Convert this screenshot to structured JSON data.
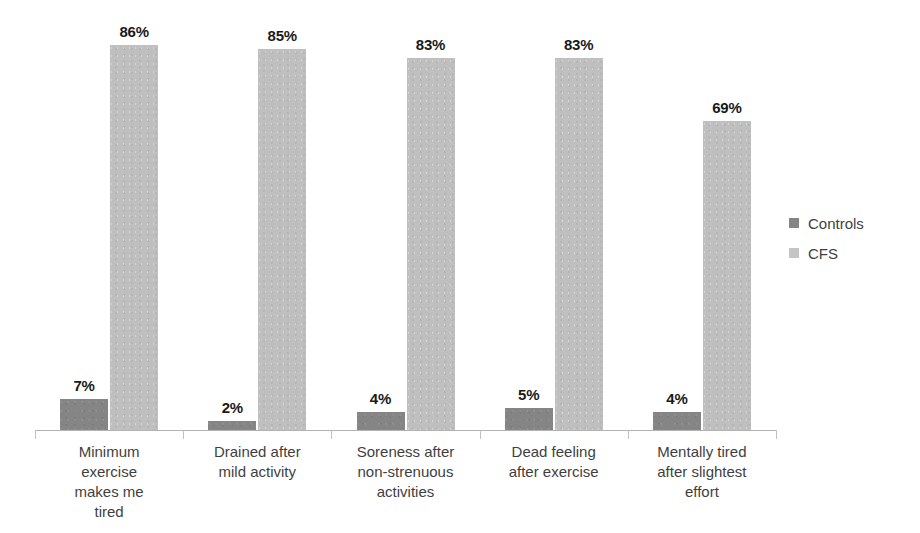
{
  "chart_data": {
    "type": "bar",
    "title": "",
    "subtitle": "",
    "xlabel": "",
    "ylabel": "",
    "ylim": [
      0,
      95
    ],
    "grid": false,
    "legend_position": "right",
    "value_suffix": "%",
    "categories": [
      "Minimum exercise makes me tired",
      "Drained after mild activity",
      "Soreness after non-strenuous activities",
      "Dead feeling after exercise",
      "Mentally tired after slightest effort"
    ],
    "category_lines": [
      [
        "Minimum",
        "exercise",
        "makes me",
        "tired"
      ],
      [
        "Drained after",
        "mild activity"
      ],
      [
        "Soreness after",
        "non-strenuous",
        "activities"
      ],
      [
        "Dead feeling",
        "after exercise"
      ],
      [
        "Mentally tired",
        "after slightest",
        "effort"
      ]
    ],
    "series": [
      {
        "name": "Controls",
        "color": "#858585",
        "values": [
          7,
          2,
          4,
          5,
          4
        ],
        "labels": [
          "7%",
          "2%",
          "4%",
          "5%",
          "4%"
        ]
      },
      {
        "name": "CFS",
        "color": "#bfbfbf",
        "values": [
          86,
          85,
          83,
          83,
          69
        ],
        "labels": [
          "86%",
          "85%",
          "83%",
          "83%",
          "69%"
        ]
      }
    ]
  },
  "legend": {
    "items": [
      {
        "label": "Controls",
        "color": "#858585"
      },
      {
        "label": "CFS",
        "color": "#c4c4c4"
      }
    ]
  },
  "axis": {
    "baseline_color": "#b3b3b3",
    "tick_color": "#c2c2c2"
  }
}
